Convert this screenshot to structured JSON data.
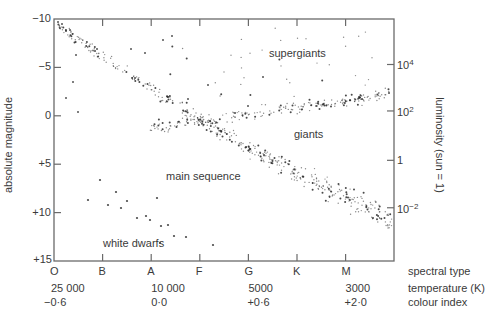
{
  "chart_data": {
    "type": "scatter",
    "ylabel_left": "absolute magnitude",
    "ylabel_right": "luminosity (sun = 1)",
    "left_axis": {
      "range": [
        -10,
        15
      ],
      "inverted": true,
      "ticks": [
        {
          "value": -10,
          "label": "−10"
        },
        {
          "value": -5,
          "label": "−5"
        },
        {
          "value": 0,
          "label": "0"
        },
        {
          "value": 5,
          "label": "+5"
        },
        {
          "value": 10,
          "label": "+10"
        },
        {
          "value": 15,
          "label": "+15"
        }
      ]
    },
    "right_axis": {
      "ticks": [
        {
          "label_base": "10",
          "label_exp": "4",
          "magnitude": -5.3
        },
        {
          "label_base": "10",
          "label_exp": "2",
          "magnitude": -0.5
        },
        {
          "label_base": "1",
          "label_exp": "",
          "magnitude": 4.6
        },
        {
          "label_base": "10",
          "label_exp": "−2",
          "magnitude": 9.5
        }
      ]
    },
    "x_axis": {
      "spectral_types": [
        "O",
        "B",
        "A",
        "F",
        "G",
        "K",
        "M"
      ],
      "spectral_type_label": "spectral type",
      "temperature_label": "temperature (K)",
      "colour_index_label": "colour index",
      "temperatures": [
        {
          "at": "O",
          "label": "25 000"
        },
        {
          "at": "A",
          "label": "10 000"
        },
        {
          "at": "G",
          "label": "5000"
        },
        {
          "at": "M",
          "label": "3000"
        }
      ],
      "colour_indices": [
        {
          "at": "O",
          "label": "−0·6"
        },
        {
          "at": "A",
          "label": "0·0"
        },
        {
          "at": "G",
          "label": "+0·6"
        },
        {
          "at": "M",
          "label": "+2·0"
        }
      ]
    },
    "regions": [
      {
        "name": "supergiants",
        "label": "supergiants",
        "spectral_range": [
          "F",
          "M"
        ],
        "magnitude_range": [
          -9,
          -4
        ],
        "count": 40
      },
      {
        "name": "giants",
        "label": "giants",
        "spectral_range": [
          "F",
          "M"
        ],
        "magnitude_range": [
          -2,
          2
        ],
        "count": 220
      },
      {
        "name": "main_sequence",
        "label": "main sequence",
        "spectral_range": [
          "O",
          "M"
        ],
        "magnitude_range": [
          -9.5,
          14
        ],
        "count": 520
      },
      {
        "name": "white_dwarfs",
        "label": "white dwarfs",
        "spectral_range": [
          "B",
          "F"
        ],
        "magnitude_range": [
          6,
          14
        ],
        "count": 16
      }
    ],
    "grid": false,
    "legend": "none (regions labelled inline)"
  },
  "labels": {
    "supergiants": "supergiants",
    "giants": "giants",
    "main_sequence": "main sequence",
    "white_dwarfs": "white dwarfs"
  },
  "style": {
    "axis_color": "#6a6a6a",
    "dot_color": "#2a2a2a",
    "text_color": "#3a3a3a"
  }
}
